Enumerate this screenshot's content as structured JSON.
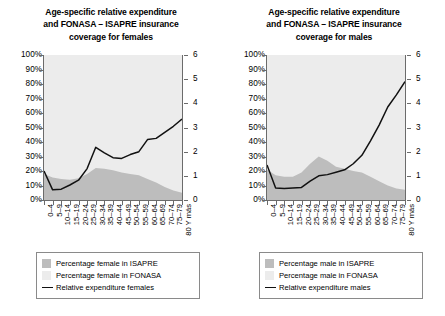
{
  "chart_data": [
    {
      "type": "area",
      "panel": "females",
      "title": "Age-specific relative expenditure and FONASA – ISAPRE insurance coverage for females",
      "title_lines": [
        "Age-specific relative expenditure",
        "and FONASA – ISAPRE insurance",
        "coverage for females"
      ],
      "xlabel": "",
      "ylabel": "",
      "categories": [
        "0–4",
        "5–9",
        "10–14",
        "15–19",
        "20–24",
        "25–29",
        "30–34",
        "35–39",
        "40–44",
        "45–49",
        "50–54",
        "55–59",
        "60–64",
        "65–69",
        "70–74",
        "75–79",
        "80 Y más"
      ],
      "y_left_ticks": [
        "0%",
        "10%",
        "20%",
        "30%",
        "40%",
        "50%",
        "60%",
        "70%",
        "80%",
        "90%",
        "100%"
      ],
      "y_left_lim": [
        0,
        100
      ],
      "y_right_ticks": [
        "0",
        "1",
        "2",
        "3",
        "4",
        "5",
        "6"
      ],
      "y_right_lim": [
        0,
        6
      ],
      "grid": false,
      "legend_position": "bottom",
      "series": [
        {
          "name": "Percentage female in ISAPRE",
          "type": "area",
          "axis": "left",
          "color": "#bdbdbd",
          "values": [
            18,
            15.5,
            14.5,
            14,
            15,
            18,
            22,
            21.5,
            20.5,
            19,
            18,
            17,
            14.5,
            12,
            9,
            6.5,
            5
          ]
        },
        {
          "name": "Percentage female in FONASA",
          "type": "area",
          "axis": "left",
          "color": "#ececec",
          "values": [
            100,
            100,
            100,
            100,
            100,
            100,
            100,
            100,
            100,
            100,
            100,
            100,
            100,
            100,
            100,
            100,
            100
          ]
        },
        {
          "name": "Relative expenditure females",
          "type": "line",
          "axis": "right",
          "color": "#111111",
          "values": [
            1.2,
            0.42,
            0.45,
            0.62,
            0.82,
            1.3,
            2.18,
            1.95,
            1.75,
            1.72,
            1.88,
            2.0,
            2.5,
            2.55,
            2.8,
            3.05,
            3.35
          ]
        }
      ],
      "legend": [
        {
          "label": "Percentage female in ISAPRE",
          "marker": "swatch",
          "color": "#bdbdbd"
        },
        {
          "label": "Percentage female in FONASA",
          "marker": "swatch",
          "color": "#ececec"
        },
        {
          "label": "Relative expenditure females",
          "marker": "line",
          "color": "#111111"
        }
      ]
    },
    {
      "type": "area",
      "panel": "males",
      "title": "Age-specific relative expenditure and FONASA – ISAPRE insurance coverage for males",
      "title_lines": [
        "Age-specific relative expenditure",
        "and FONASA – ISAPRE insurance",
        "coverage for males"
      ],
      "xlabel": "",
      "ylabel": "",
      "categories": [
        "0–4",
        "5–9",
        "10–14",
        "15–19",
        "20–24",
        "25–29",
        "30–34",
        "35–39",
        "40–44",
        "45–49",
        "50–54",
        "55–59",
        "60–64",
        "65–69",
        "70–74",
        "75–79",
        "80 Y más"
      ],
      "y_left_ticks": [
        "0%",
        "10%",
        "20%",
        "30%",
        "40%",
        "50%",
        "60%",
        "70%",
        "80%",
        "90%",
        "100%"
      ],
      "y_left_lim": [
        0,
        100
      ],
      "y_right_ticks": [
        "0",
        "1",
        "2",
        "3",
        "4",
        "5",
        "6"
      ],
      "y_right_lim": [
        0,
        6
      ],
      "grid": false,
      "legend_position": "bottom",
      "series": [
        {
          "name": "Percentage male in ISAPRE",
          "type": "area",
          "axis": "left",
          "color": "#bdbdbd",
          "values": [
            21,
            17,
            16,
            16,
            19,
            25,
            30,
            27,
            23,
            21.5,
            20,
            19,
            16,
            13,
            10,
            8,
            7
          ]
        },
        {
          "name": "Percentage male in FONASA",
          "type": "area",
          "axis": "left",
          "color": "#ececec",
          "values": [
            100,
            100,
            100,
            100,
            100,
            100,
            100,
            100,
            100,
            100,
            100,
            100,
            100,
            100,
            100,
            100,
            100
          ]
        },
        {
          "name": "Relative expenditure males",
          "type": "line",
          "axis": "right",
          "color": "#111111",
          "values": [
            1.45,
            0.5,
            0.48,
            0.5,
            0.52,
            0.78,
            1.0,
            1.05,
            1.15,
            1.25,
            1.5,
            1.85,
            2.45,
            3.1,
            3.85,
            4.35,
            4.9
          ]
        }
      ],
      "legend": [
        {
          "label": "Percentage male in ISAPRE",
          "marker": "swatch",
          "color": "#bdbdbd"
        },
        {
          "label": "Percentage male in FONASA",
          "marker": "swatch",
          "color": "#ececec"
        },
        {
          "label": "Relative expenditure males",
          "marker": "line",
          "color": "#111111"
        }
      ]
    }
  ],
  "colors": {
    "isapre": "#bdbdbd",
    "fonasa": "#ececec",
    "line": "#111111",
    "plot_background": "#ebebeb",
    "axis": "#6b6b6b"
  }
}
